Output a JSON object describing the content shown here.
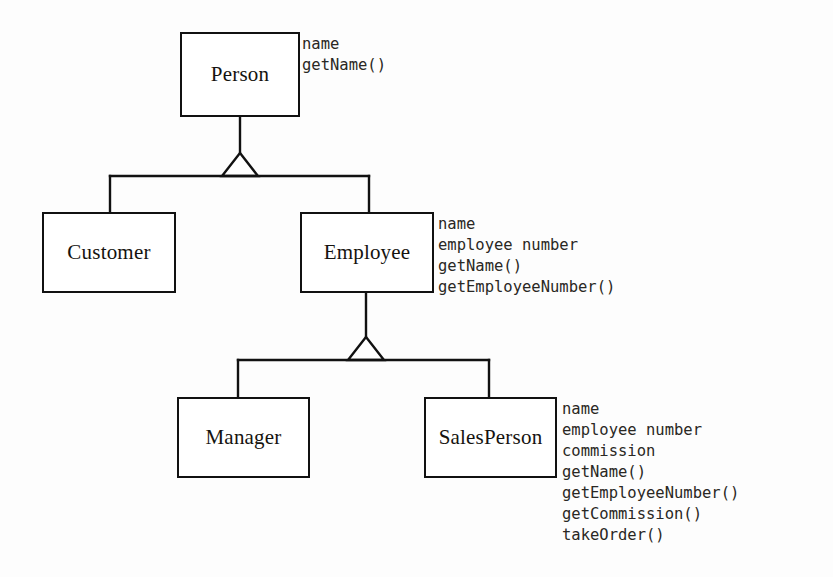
{
  "diagram": {
    "type": "uml-class-diagram",
    "background_color": "#fdfdfd",
    "line_color": "#111111",
    "text_color": "#15130f"
  },
  "classes": [
    {
      "id": "person",
      "name": "Person",
      "box": {
        "x": 180,
        "y": 32,
        "w": 120,
        "h": 85
      },
      "members_position": {
        "x": 302,
        "y": 34
      },
      "members": [
        "name",
        "getName()"
      ]
    },
    {
      "id": "customer",
      "name": "Customer",
      "box": {
        "x": 42,
        "y": 212,
        "w": 134,
        "h": 81
      },
      "members_position": {
        "x": 180,
        "y": 214
      },
      "members": []
    },
    {
      "id": "employee",
      "name": "Employee",
      "box": {
        "x": 300,
        "y": 212,
        "w": 134,
        "h": 81
      },
      "members_position": {
        "x": 438,
        "y": 214
      },
      "members": [
        "name",
        "employee number",
        "getName()",
        "getEmployeeNumber()"
      ]
    },
    {
      "id": "manager",
      "name": "Manager",
      "box": {
        "x": 177,
        "y": 397,
        "w": 133,
        "h": 81
      },
      "members_position": {
        "x": 314,
        "y": 399
      },
      "members": []
    },
    {
      "id": "salesperson",
      "name": "SalesPerson",
      "box": {
        "x": 424,
        "y": 397,
        "w": 133,
        "h": 81
      },
      "members_position": {
        "x": 562,
        "y": 399
      },
      "members": [
        "name",
        "employee number",
        "commission",
        "getName()",
        "getEmployeeNumber()",
        "getCommission()",
        "takeOrder()"
      ]
    }
  ],
  "generalizations": [
    {
      "id": "person-generalization",
      "parent": "Person",
      "children": [
        "Customer",
        "Employee"
      ],
      "stem": {
        "x": 240,
        "y_top": 117,
        "y_apex": 153
      },
      "triangle": {
        "apex_x": 240,
        "apex_y": 153,
        "base_y": 176,
        "half_width": 18
      },
      "bar": {
        "y": 176,
        "x_left": 110,
        "x_right": 369
      },
      "drops": [
        {
          "x": 110,
          "y_top": 176,
          "y_bottom": 212
        },
        {
          "x": 369,
          "y_top": 176,
          "y_bottom": 212
        }
      ]
    },
    {
      "id": "employee-generalization",
      "parent": "Employee",
      "children": [
        "Manager",
        "SalesPerson"
      ],
      "stem": {
        "x": 366,
        "y_top": 293,
        "y_apex": 337
      },
      "triangle": {
        "apex_x": 366,
        "apex_y": 337,
        "base_y": 360,
        "half_width": 18
      },
      "bar": {
        "y": 360,
        "x_left": 238,
        "x_right": 489
      },
      "drops": [
        {
          "x": 238,
          "y_top": 360,
          "y_bottom": 397
        },
        {
          "x": 489,
          "y_top": 360,
          "y_bottom": 397
        }
      ]
    }
  ]
}
